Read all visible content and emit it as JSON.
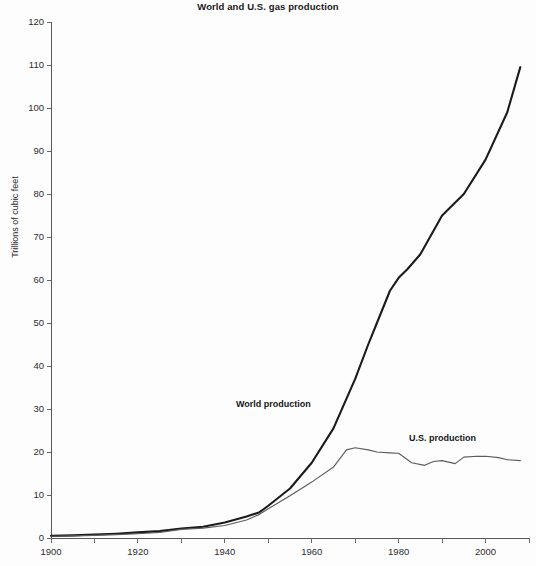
{
  "chart_data": {
    "type": "line",
    "title": "World and U.S. gas production",
    "xlabel": "",
    "ylabel": "Trillions of cubic feet",
    "xlim": [
      1900,
      2010
    ],
    "ylim": [
      0,
      120
    ],
    "y_ticks": [
      0,
      10,
      20,
      30,
      40,
      50,
      60,
      70,
      80,
      90,
      100,
      110,
      120
    ],
    "y_tick_labels": [
      "0",
      "10",
      "20",
      "30",
      "40",
      "50",
      "60",
      "70",
      "80",
      "90",
      "100",
      "110",
      "120"
    ],
    "x_ticks": [
      1900,
      1910,
      1920,
      1930,
      1940,
      1950,
      1960,
      1970,
      1980,
      1990,
      2000,
      2010
    ],
    "x_tick_labels": [
      "1900",
      "",
      "1920",
      "",
      "1940",
      "",
      "1960",
      "",
      "1980",
      "",
      "2000",
      ""
    ],
    "x_major_labels": [
      "1900",
      "1920",
      "1940",
      "1960",
      "1980",
      "2000"
    ],
    "grid": false,
    "legend_position": "inline-annotation",
    "series": [
      {
        "name": "World production",
        "color": "#1b1b1d",
        "annotation_label": "World production",
        "x": [
          1900,
          1905,
          1910,
          1915,
          1920,
          1925,
          1930,
          1935,
          1940,
          1945,
          1948,
          1950,
          1955,
          1960,
          1965,
          1970,
          1973,
          1975,
          1978,
          1980,
          1982,
          1985,
          1990,
          1995,
          2000,
          2005,
          2008
        ],
        "values": [
          0.5,
          0.6,
          0.8,
          1.0,
          1.3,
          1.6,
          2.2,
          2.6,
          3.6,
          5.0,
          6.0,
          7.5,
          11.5,
          17.5,
          25.5,
          37.0,
          45.0,
          50.0,
          57.5,
          60.5,
          62.5,
          66.0,
          75.0,
          80.0,
          88.0,
          99.0,
          109.5
        ]
      },
      {
        "name": "U.S. production",
        "color": "#5c5c60",
        "annotation_label": "U.S. production",
        "x": [
          1900,
          1905,
          1910,
          1915,
          1920,
          1925,
          1930,
          1935,
          1940,
          1945,
          1948,
          1950,
          1955,
          1960,
          1965,
          1968,
          1970,
          1973,
          1975,
          1978,
          1980,
          1983,
          1986,
          1988,
          1990,
          1993,
          1995,
          1998,
          2000,
          2003,
          2005,
          2008
        ],
        "values": [
          0.4,
          0.5,
          0.6,
          0.8,
          1.0,
          1.3,
          2.0,
          2.3,
          2.9,
          4.2,
          5.5,
          6.8,
          9.8,
          13.0,
          16.5,
          20.5,
          21.0,
          20.5,
          20.0,
          19.8,
          19.7,
          17.5,
          16.9,
          17.8,
          18.0,
          17.3,
          18.8,
          19.0,
          19.0,
          18.7,
          18.2,
          18.0
        ]
      }
    ]
  }
}
